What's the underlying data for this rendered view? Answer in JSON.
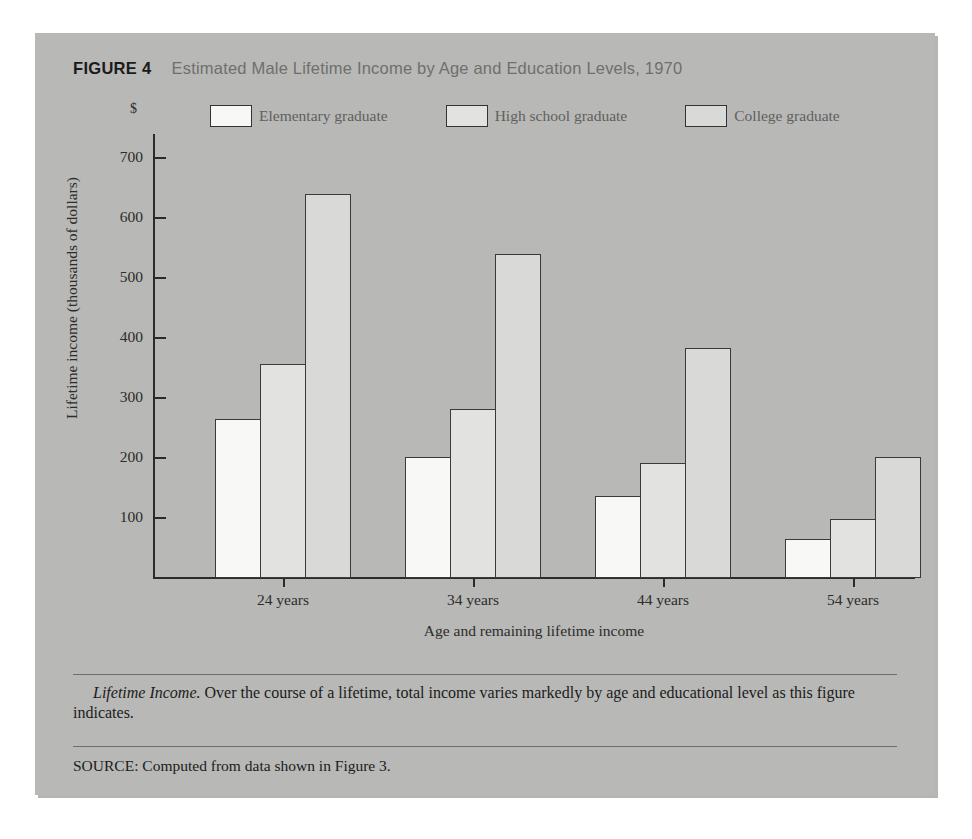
{
  "figure": {
    "label": "FIGURE 4",
    "title": "Estimated Male Lifetime Income by Age and Education Levels, 1970",
    "caption_lead": "Lifetime Income.",
    "caption_body": " Over the course of a lifetime, total income varies markedly by age and educational level as this figure indicates.",
    "source_label": "SOURCE:",
    "source_text": " Computed from data shown in Figure 3."
  },
  "colors": {
    "panel_background": "#b8b8b6",
    "axis": "#2b2b2b",
    "title_gray": "#6f6f6d",
    "elementary_fill": "#f8f8f6",
    "highschool_fill": "#e2e2e0",
    "college_fill": "#d9d9d7",
    "bar_outline": "#3a3a3a"
  },
  "chart_data": {
    "type": "bar",
    "title": "Estimated Male Lifetime Income by Age and Education Levels, 1970",
    "xlabel": "Age and remaining lifetime income",
    "ylabel": "Lifetime income (thousands of dollars)",
    "y_unit_symbol": "$",
    "categories": [
      "24 years",
      "34 years",
      "44 years",
      "54 years"
    ],
    "series": [
      {
        "name": "Elementary graduate",
        "values": [
          265,
          202,
          136,
          65
        ],
        "fill": "#f8f8f6"
      },
      {
        "name": "High school graduate",
        "values": [
          357,
          281,
          191,
          98
        ],
        "fill": "#e2e2e0"
      },
      {
        "name": "College graduate",
        "values": [
          640,
          540,
          384,
          201
        ],
        "fill": "#d9d9d7"
      }
    ],
    "ylim": [
      0,
      740
    ],
    "yticks": [
      100,
      200,
      300,
      400,
      500,
      600,
      700
    ],
    "ytick_labels": [
      "100",
      "200",
      "300",
      "400",
      "500",
      "600",
      "700"
    ],
    "grid": false,
    "legend_position": "top"
  }
}
